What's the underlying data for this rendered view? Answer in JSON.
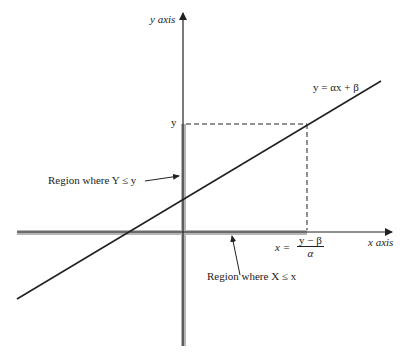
{
  "diagram": {
    "type": "coordinate-plot",
    "axes": {
      "y_label": "y axis",
      "x_label": "x axis"
    },
    "line_equation": "y = αx + β",
    "y_tick_label": "y",
    "x_point": {
      "lhs": "x =",
      "numerator": "y − β",
      "denominator": "α"
    },
    "annotations": {
      "y_region": "Region where Y ≤ y",
      "x_region": "Region where X ≤ x"
    },
    "colors": {
      "line": "#222222",
      "shaded_region": "#b0b0b0"
    }
  }
}
